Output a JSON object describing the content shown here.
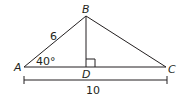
{
  "diagram": {
    "type": "triangle",
    "vertices": {
      "A": "A",
      "B": "B",
      "C": "C",
      "D": "D"
    },
    "labels": {
      "side_AB": "6",
      "angle_A": "40°",
      "base_AC": "10"
    },
    "colors": {
      "line": "#231f20"
    }
  }
}
